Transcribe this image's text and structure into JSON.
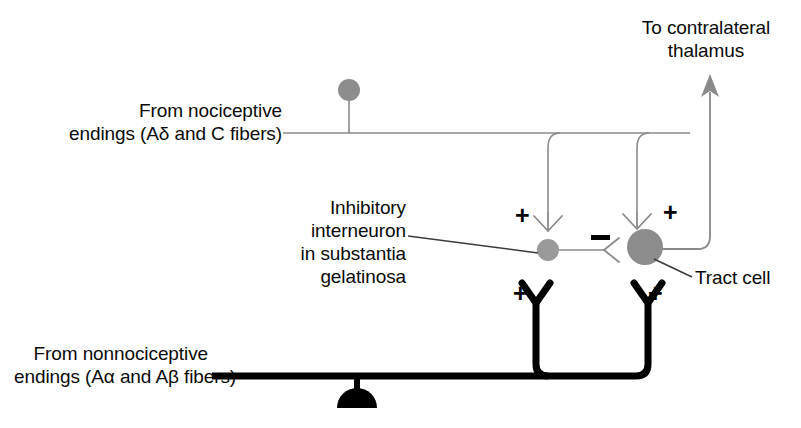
{
  "figure": {
    "type": "neuroscience-circuit-diagram",
    "title_visible": false,
    "background_color": "#ffffff"
  },
  "labels": {
    "nociceptive_input": "From nociceptive\nendings (Aδ and C fibers)",
    "nonnociceptive_input": "From nonnociceptive\nendings (Aα and Aβ fibers)",
    "thalamus_output": "To contralateral\nthalamus",
    "interneuron": "Inhibitory\ninterneuron\nin substantia\ngelatinosa",
    "tract_cell": "Tract cell"
  },
  "signs": {
    "plus": "+",
    "minus": "−",
    "plus_interneuron_top": "+",
    "plus_tractcell_top": "+",
    "plus_interneuron_bottom": "+",
    "plus_tractcell_bottom": "+"
  },
  "colors": {
    "soma_gray": "#8c8c8c",
    "soma_gray_dark": "#7f7f7f",
    "thin_fiber": "#8a8a8a",
    "thick_fiber": "#000000",
    "text": "#0a0a0a",
    "leader_line": "#3a3a3a"
  },
  "elements": {
    "nociceptive_soma": {
      "cx": 349,
      "cy": 90,
      "r": 11,
      "fill": "#8c8c8c"
    },
    "interneuron_soma": {
      "cx": 548,
      "cy": 250,
      "r": 11,
      "fill": "#9a9a9a"
    },
    "tract_cell_soma": {
      "cx": 645,
      "cy": 247,
      "r": 18,
      "fill": "#8c8c8c"
    },
    "nonnociceptive_soma": {
      "cx": 357,
      "cy": 383,
      "r": 20,
      "shape": "half-dome",
      "fill": "#000000"
    },
    "thalamus_arrow": {
      "x": 710,
      "tip_y": 78,
      "base_y": 247,
      "color": "#8a8a8a"
    }
  },
  "connections": [
    {
      "from": "nociceptive-fiber",
      "to": "inhibitory-interneuron",
      "sign": "+",
      "style": "thin-gray"
    },
    {
      "from": "nociceptive-fiber",
      "to": "tract-cell",
      "sign": "+",
      "style": "thin-gray"
    },
    {
      "from": "inhibitory-interneuron",
      "to": "tract-cell",
      "sign": "−",
      "style": "thin-gray"
    },
    {
      "from": "nonnociceptive-fiber",
      "to": "inhibitory-interneuron",
      "sign": "+",
      "style": "thick-black"
    },
    {
      "from": "nonnociceptive-fiber",
      "to": "tract-cell",
      "sign": "+",
      "style": "thick-black"
    },
    {
      "from": "tract-cell",
      "to": "contralateral-thalamus",
      "sign": "",
      "style": "thin-gray-arrow"
    }
  ]
}
